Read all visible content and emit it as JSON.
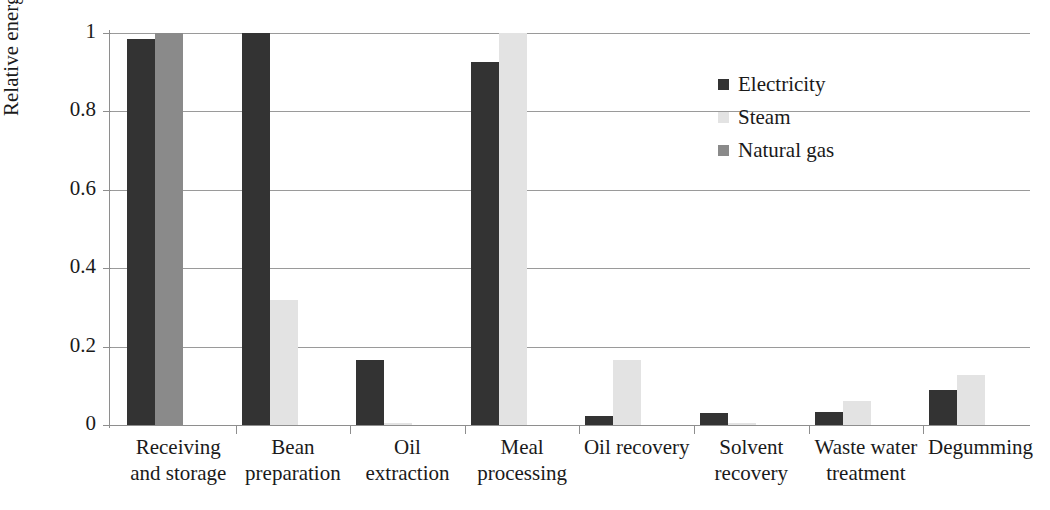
{
  "chart_data": {
    "type": "bar",
    "title": "",
    "xlabel": "",
    "ylabel": "Relative energy",
    "ylim": [
      0,
      1
    ],
    "yticks": [
      "0",
      "0.2",
      "0.4",
      "0.6",
      "0.8",
      "1"
    ],
    "ytick_values": [
      0,
      0.2,
      0.4,
      0.6,
      0.8,
      1
    ],
    "grid": true,
    "legend_position": "top-right",
    "categories": [
      "Receiving\nand storage",
      "Bean\npreparation",
      "Oil\nextraction",
      "Meal\nprocessing",
      "Oil recovery",
      "Solvent\nrecovery",
      "Waste water\ntreatment",
      "Degumming"
    ],
    "series": [
      {
        "name": "Electricity",
        "color": "#333333",
        "values": [
          0.985,
          1.0,
          0.167,
          0.925,
          0.023,
          0.03,
          0.033,
          0.09
        ]
      },
      {
        "name": "Steam",
        "color": "#e3e3e3",
        "values": [
          0,
          0.318,
          0.005,
          1.0,
          0.165,
          0.006,
          0.06,
          0.127
        ]
      },
      {
        "name": "Natural gas",
        "color": "#8a8a8a",
        "values": [
          1.0,
          0,
          0,
          0,
          0,
          0,
          0,
          0
        ]
      }
    ]
  },
  "legend": {
    "items": [
      {
        "label": "Electricity",
        "swatch": "electricity"
      },
      {
        "label": "Steam",
        "swatch": "steam"
      },
      {
        "label": "Natural gas",
        "swatch": "naturalgas"
      }
    ]
  }
}
